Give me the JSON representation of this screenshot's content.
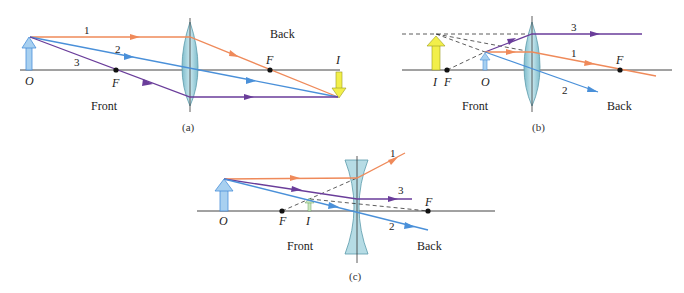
{
  "colors": {
    "ray_1": "#ef8a5a",
    "ray_2": "#4a90d9",
    "ray_3": "#6a3d9a",
    "object_arrow": "#a8d0f0",
    "image_arrow": "#f2ef4a",
    "lens_fill": "#a9d6e0",
    "axis": "#444444"
  },
  "panels": [
    {
      "caption": "(a)",
      "type": "converging lens, object outside focal point",
      "labels": {
        "object": "O",
        "image": "I",
        "focal_front": "F",
        "focal_back": "F",
        "front": "Front",
        "back": "Back"
      },
      "rays": [
        "1",
        "2",
        "3"
      ]
    },
    {
      "caption": "(b)",
      "type": "converging lens, object inside focal point",
      "labels": {
        "object": "O",
        "image": "I",
        "focal_front": "F",
        "focal_back": "F",
        "front": "Front",
        "back": "Back"
      },
      "rays": [
        "3",
        "1",
        "2"
      ]
    },
    {
      "caption": "(c)",
      "type": "diverging lens",
      "labels": {
        "object": "O",
        "image": "I",
        "focal_front": "F",
        "focal_back": "F",
        "front": "Front",
        "back": "Back"
      },
      "rays": [
        "1",
        "3",
        "2"
      ]
    }
  ]
}
